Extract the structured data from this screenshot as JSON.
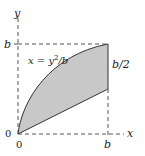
{
  "diagram": {
    "axes": {
      "x_label": "x",
      "y_label": "y",
      "origin_labels": [
        "0",
        "0"
      ]
    },
    "ticks": {
      "x_b": "b",
      "y_b": "b"
    },
    "curve_label": {
      "lhs": "x = y",
      "exp": "2",
      "rhs": "/b"
    },
    "segment_label": "b/2",
    "colors": {
      "fill": "#c8c8c8",
      "stroke": "#333333",
      "dash": "#555555"
    }
  }
}
